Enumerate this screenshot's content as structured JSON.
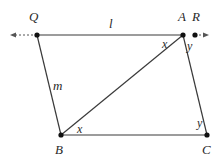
{
  "diagram": {
    "type": "geometry-figure",
    "points": [
      {
        "name": "Q",
        "x": 37,
        "y": 35,
        "label_x": 29,
        "label_y": 21
      },
      {
        "name": "A",
        "x": 183,
        "y": 35,
        "label_x": 178,
        "label_y": 21
      },
      {
        "name": "R",
        "x": 195,
        "y": 35,
        "label_x": 192,
        "label_y": 21
      },
      {
        "name": "B",
        "x": 61,
        "y": 135,
        "label_x": 55,
        "label_y": 154
      },
      {
        "name": "C",
        "x": 207,
        "y": 135,
        "label_x": 202,
        "label_y": 154
      }
    ],
    "segments": [
      {
        "name": "QA",
        "from": "Q",
        "to": "A"
      },
      {
        "name": "QB",
        "from": "Q",
        "to": "B"
      },
      {
        "name": "AB",
        "from": "A",
        "to": "B"
      },
      {
        "name": "AC",
        "from": "A",
        "to": "C"
      },
      {
        "name": "BC",
        "from": "B",
        "to": "C"
      }
    ],
    "line_labels": [
      {
        "text": "l",
        "x": 109,
        "y": 28,
        "describes": "line QA"
      },
      {
        "text": "m",
        "x": 53,
        "y": 90,
        "describes": "line QB"
      }
    ],
    "angle_labels": [
      {
        "text": "x",
        "x": 162,
        "y": 48,
        "at": "A",
        "between": "AQ and AB"
      },
      {
        "text": "y",
        "x": 187,
        "y": 50,
        "at": "A",
        "between": "AR and AC"
      },
      {
        "text": "x",
        "x": 77,
        "y": 133,
        "at": "B",
        "between": "BA and BC"
      },
      {
        "text": "y",
        "x": 197,
        "y": 127,
        "at": "C",
        "between": "CA and CB"
      }
    ],
    "extensions": [
      {
        "name": "left-extension",
        "from_x": 37,
        "to_x": 12,
        "y": 35,
        "style": "dashed-arrow"
      },
      {
        "name": "right-extension",
        "from_x": 195,
        "to_x": 207,
        "y": 35,
        "style": "dashed-arrow"
      }
    ]
  }
}
